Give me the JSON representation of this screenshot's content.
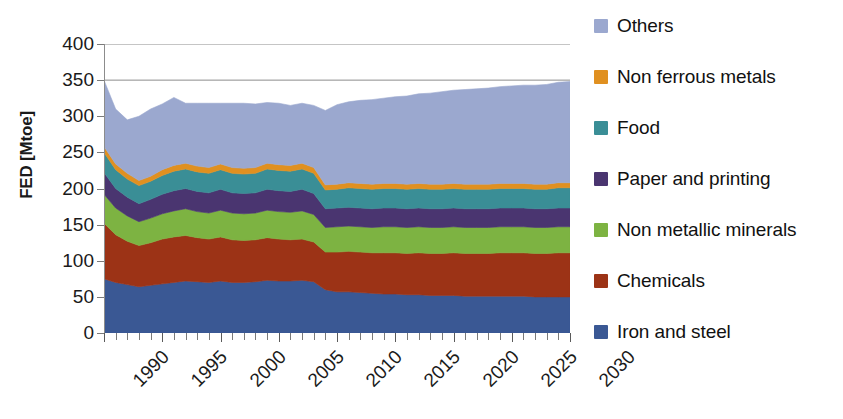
{
  "chart_data": {
    "type": "area",
    "stacked": true,
    "title": "",
    "xlabel": "",
    "ylabel": "FED [Mtoe]",
    "xlim": [
      1990,
      2030
    ],
    "ylim": [
      0,
      400
    ],
    "ytick_values": [
      0,
      50,
      100,
      150,
      200,
      250,
      300,
      350,
      400
    ],
    "ytick_labels": [
      "0",
      "50",
      "100",
      "150",
      "200",
      "250",
      "300",
      "350",
      "400"
    ],
    "xtick_values": [
      1990,
      1995,
      2000,
      2005,
      2010,
      2015,
      2020,
      2025,
      2030
    ],
    "xtick_labels": [
      "1990",
      "1995",
      "2000",
      "2005",
      "2010",
      "2015",
      "2020",
      "2025",
      "2030"
    ],
    "x_minor_tick_step": 1,
    "grid": "horizontal-top-only",
    "legend_position": "right",
    "x": [
      1990,
      1991,
      1992,
      1993,
      1994,
      1995,
      1996,
      1997,
      1998,
      1999,
      2000,
      2001,
      2002,
      2003,
      2004,
      2005,
      2006,
      2007,
      2008,
      2009,
      2010,
      2011,
      2012,
      2013,
      2014,
      2015,
      2016,
      2017,
      2018,
      2019,
      2020,
      2021,
      2022,
      2023,
      2024,
      2025,
      2026,
      2027,
      2028,
      2029,
      2030
    ],
    "series": [
      {
        "name": "Iron and steel",
        "color": "#3A5894",
        "values": [
          75,
          70,
          67,
          64,
          66,
          68,
          70,
          72,
          71,
          70,
          72,
          70,
          70,
          71,
          73,
          72,
          72,
          73,
          71,
          60,
          57,
          57,
          56,
          55,
          54,
          54,
          53,
          53,
          52,
          52,
          52,
          51,
          51,
          51,
          51,
          51,
          51,
          50,
          50,
          50,
          50
        ]
      },
      {
        "name": "Chemicals",
        "color": "#9C3316",
        "values": [
          77,
          66,
          60,
          57,
          59,
          62,
          63,
          63,
          61,
          60,
          61,
          59,
          58,
          58,
          59,
          58,
          57,
          57,
          55,
          52,
          55,
          56,
          56,
          56,
          57,
          57,
          57,
          58,
          58,
          58,
          59,
          59,
          59,
          59,
          60,
          60,
          60,
          60,
          60,
          61,
          61
        ]
      },
      {
        "name": "Non metallic minerals",
        "color": "#7DB342",
        "values": [
          40,
          37,
          35,
          33,
          34,
          35,
          36,
          37,
          36,
          36,
          37,
          37,
          37,
          37,
          38,
          38,
          38,
          39,
          38,
          34,
          35,
          35,
          35,
          35,
          36,
          36,
          36,
          36,
          36,
          36,
          36,
          36,
          36,
          36,
          36,
          36,
          36,
          36,
          36,
          36,
          36
        ]
      },
      {
        "name": "Paper and printing",
        "color": "#4A3570",
        "values": [
          30,
          27,
          26,
          25,
          26,
          27,
          28,
          28,
          28,
          28,
          29,
          28,
          28,
          28,
          29,
          29,
          29,
          30,
          29,
          26,
          26,
          26,
          26,
          26,
          26,
          26,
          26,
          26,
          26,
          26,
          26,
          26,
          26,
          26,
          26,
          26,
          26,
          26,
          26,
          26,
          26
        ]
      },
      {
        "name": "Food",
        "color": "#3A8E96",
        "values": [
          28,
          26,
          25,
          25,
          25,
          26,
          27,
          27,
          27,
          27,
          27,
          27,
          27,
          27,
          28,
          28,
          28,
          28,
          28,
          26,
          26,
          27,
          27,
          27,
          27,
          27,
          27,
          27,
          27,
          27,
          27,
          27,
          27,
          27,
          27,
          27,
          27,
          27,
          27,
          28,
          28
        ]
      },
      {
        "name": "Non ferrous metals",
        "color": "#E09020",
        "values": [
          8,
          8,
          8,
          7,
          7,
          8,
          8,
          8,
          8,
          8,
          8,
          8,
          8,
          8,
          8,
          8,
          8,
          8,
          8,
          7,
          7,
          7,
          7,
          7,
          7,
          7,
          7,
          7,
          7,
          7,
          7,
          7,
          7,
          7,
          7,
          7,
          7,
          7,
          7,
          7,
          7
        ]
      },
      {
        "name": "Others",
        "color": "#9BA8CF",
        "values": [
          92,
          76,
          74,
          89,
          93,
          91,
          94,
          83,
          87,
          89,
          84,
          89,
          90,
          88,
          84,
          85,
          83,
          83,
          86,
          103,
          110,
          112,
          115,
          117,
          118,
          120,
          122,
          124,
          126,
          128,
          129,
          131,
          132,
          133,
          134,
          135,
          136,
          137,
          138,
          139,
          140
        ]
      }
    ],
    "totals": [
      350,
      310,
      295,
      300,
      310,
      317,
      326,
      318,
      318,
      318,
      318,
      318,
      318,
      317,
      319,
      318,
      315,
      318,
      315,
      308,
      316,
      320,
      322,
      323,
      325,
      327,
      328,
      331,
      332,
      334,
      336,
      337,
      338,
      339,
      341,
      342,
      343,
      343,
      344,
      347,
      348
    ]
  },
  "legend": {
    "items": [
      {
        "label": "Others",
        "color": "#9BA8CF"
      },
      {
        "label": "Non ferrous metals",
        "color": "#E09020"
      },
      {
        "label": "Food",
        "color": "#3A8E96"
      },
      {
        "label": "Paper and printing",
        "color": "#4A3570"
      },
      {
        "label": "Non metallic minerals",
        "color": "#7DB342"
      },
      {
        "label": "Chemicals",
        "color": "#9C3316"
      },
      {
        "label": "Iron and steel",
        "color": "#3A5894"
      }
    ]
  },
  "axes": {
    "y_title": "FED [Mtoe]"
  }
}
